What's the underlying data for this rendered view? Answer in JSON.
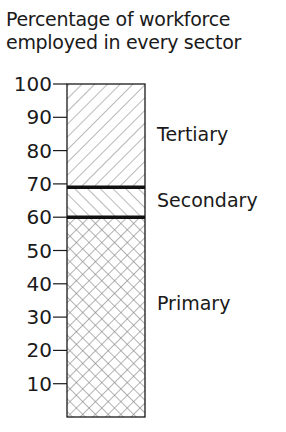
{
  "chart_data": {
    "type": "bar",
    "subtype": "stacked-single-column",
    "title": "Percentage of workforce employed in every sector",
    "title_lines": [
      "Percentage of workforce",
      "employed in every sector"
    ],
    "xlabel": "",
    "ylabel": "",
    "ylim": [
      0,
      100
    ],
    "yticks": [
      10,
      20,
      30,
      40,
      50,
      60,
      70,
      80,
      90,
      100
    ],
    "grid": false,
    "legend": "inline labels to the right of the bar",
    "categories": [
      "Workforce"
    ],
    "series": [
      {
        "name": "Primary",
        "values": [
          60
        ],
        "range": [
          0,
          60
        ],
        "pattern": "crosshatch"
      },
      {
        "name": "Secondary",
        "values": [
          9
        ],
        "range": [
          60,
          69
        ],
        "pattern": "diagonal-back"
      },
      {
        "name": "Tertiary",
        "values": [
          31
        ],
        "range": [
          69,
          100
        ],
        "pattern": "diagonal-forward"
      }
    ]
  },
  "labels": {
    "tertiary": "Tertiary",
    "secondary": "Secondary",
    "primary": "Primary"
  },
  "colors": {
    "ink": "#1a1a1a",
    "hatch": "#8a8a8a",
    "background": "#ffffff"
  }
}
